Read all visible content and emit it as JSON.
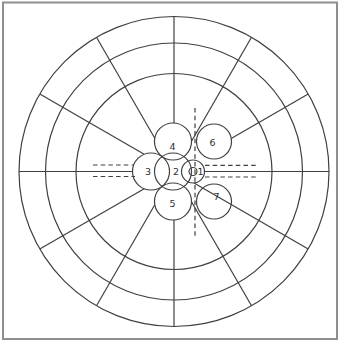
{
  "diagram": {
    "background": "#ffffff",
    "line_color": "#404040",
    "frame_color": "#8f8f8f",
    "label_color": "#2f2f2f",
    "grid": {
      "rings": 3,
      "spokes": 12
    },
    "cluster_labels": [
      "1",
      "2",
      "3",
      "4",
      "5",
      "6",
      "7"
    ]
  }
}
